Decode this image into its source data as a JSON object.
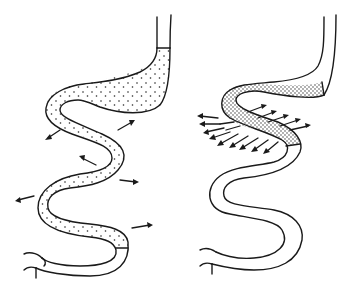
{
  "diagram": {
    "colors": {
      "stroke": "#1a1a1a",
      "background": "#ffffff"
    },
    "figures": [
      {
        "id": "left",
        "label": "Stomach and intestine filled with sparse dotted contents, scattered outward arrows",
        "fill_pattern": "sparse-dots",
        "arrow_count": 6
      },
      {
        "id": "right",
        "label": "Intestinal segment with dense dotted contents, dense fan of outward arrows",
        "fill_pattern": "dense-dots",
        "arrow_count": 16
      }
    ]
  }
}
